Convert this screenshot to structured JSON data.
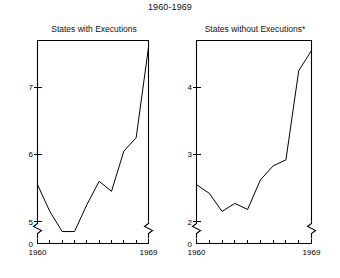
{
  "figure": {
    "title": "1960-1969",
    "width": 340,
    "height": 278,
    "background": "#ffffff",
    "line_color": "#000000"
  },
  "panels": [
    {
      "id": "left",
      "title": "States with Executions",
      "axis_break": true,
      "x_axis": {
        "label_start": "1960",
        "label_end": "1969",
        "ticks": [
          1960,
          1961,
          1962,
          1963,
          1964,
          1965,
          1966,
          1967,
          1968,
          1969
        ],
        "range": [
          1960,
          1969
        ]
      },
      "y_axis": {
        "tick_labels": [
          "0",
          "5",
          "6",
          "7"
        ],
        "tick_values": [
          0,
          5,
          6,
          7
        ],
        "range": [
          5.0,
          7.7
        ],
        "break_below": 5.0
      }
    },
    {
      "id": "right",
      "title": "States without Executions*",
      "axis_break": true,
      "x_axis": {
        "label_start": "1960",
        "label_end": "1969",
        "ticks": [
          1960,
          1961,
          1962,
          1963,
          1964,
          1965,
          1966,
          1967,
          1968,
          1969
        ],
        "range": [
          1960,
          1969
        ]
      },
      "y_axis": {
        "tick_labels": [
          "0",
          "2",
          "3",
          "4"
        ],
        "tick_values": [
          0,
          2,
          3,
          4
        ],
        "range": [
          2.0,
          4.7
        ],
        "break_below": 2.0
      }
    }
  ],
  "chart_data": [
    {
      "type": "line",
      "title": "States with Executions",
      "suptitle": "1960-1969",
      "xlabel": "",
      "ylabel": "",
      "x": [
        1960,
        1961,
        1962,
        1963,
        1964,
        1965,
        1966,
        1967,
        1968,
        1969
      ],
      "categories": [
        "1960",
        "1961",
        "1962",
        "1963",
        "1964",
        "1965",
        "1966",
        "1967",
        "1968",
        "1969"
      ],
      "values": [
        5.55,
        5.15,
        4.85,
        4.85,
        5.25,
        5.6,
        5.45,
        6.05,
        6.25,
        7.6
      ],
      "xlim": [
        1960,
        1969
      ],
      "ylim": [
        5.0,
        7.7
      ],
      "yticks": [
        5,
        6,
        7
      ],
      "ytick_labels": [
        "5",
        "6",
        "7"
      ],
      "zero_tick_label": "0",
      "xticks": [
        1960,
        1961,
        1962,
        1963,
        1964,
        1965,
        1966,
        1967,
        1968,
        1969
      ],
      "xtick_labels": [
        "1960",
        "",
        "",
        "",
        "",
        "",
        "",
        "",
        "",
        "1969"
      ],
      "grid": false,
      "legend": "none",
      "axis_break_y": true
    },
    {
      "type": "line",
      "title": "States without Executions*",
      "suptitle": "1960-1969",
      "xlabel": "",
      "ylabel": "",
      "x": [
        1960,
        1961,
        1962,
        1963,
        1964,
        1965,
        1966,
        1967,
        1968,
        1969
      ],
      "categories": [
        "1960",
        "1961",
        "1962",
        "1963",
        "1964",
        "1965",
        "1966",
        "1967",
        "1968",
        "1969"
      ],
      "values": [
        2.55,
        2.42,
        2.15,
        2.27,
        2.18,
        2.62,
        2.83,
        2.92,
        4.25,
        4.55
      ],
      "xlim": [
        1960,
        1969
      ],
      "ylim": [
        2.0,
        4.7
      ],
      "yticks": [
        2,
        3,
        4
      ],
      "ytick_labels": [
        "2",
        "3",
        "4"
      ],
      "zero_tick_label": "0",
      "xticks": [
        1960,
        1961,
        1962,
        1963,
        1964,
        1965,
        1966,
        1967,
        1968,
        1969
      ],
      "xtick_labels": [
        "1960",
        "",
        "",
        "",
        "",
        "",
        "",
        "",
        "",
        "1969"
      ],
      "grid": false,
      "legend": "none",
      "axis_break_y": true
    }
  ]
}
